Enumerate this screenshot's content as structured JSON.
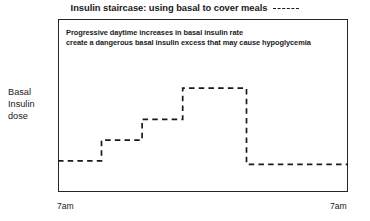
{
  "chart_data": {
    "type": "line",
    "title": "Insulin staircase: using basal to cover meals",
    "xlabel": "",
    "ylabel": "Basal Insulin dose",
    "annotation_lines": [
      "Progressive daytime increases in basal insulin rate",
      "create a dangerous basal insulin excess that may cause hypoglycemia"
    ],
    "x_tick_labels": [
      "7am",
      "7am"
    ],
    "y_tick_labels": [],
    "grid": false,
    "legend_position": "title-inline",
    "series": [
      {
        "name": "Basal insulin rate",
        "style": "dashed",
        "color": "#1a1a1a",
        "step_type": "post",
        "x": [
          0,
          15,
          15,
          29,
          29,
          43,
          43,
          65,
          65,
          100
        ],
        "y": [
          18,
          18,
          30,
          30,
          42,
          42,
          60,
          60,
          16,
          16
        ],
        "segments": [
          {
            "label": "overnight basal",
            "x_start": 0,
            "x_end": 15,
            "level": 18
          },
          {
            "label": "morning step",
            "x_start": 15,
            "x_end": 29,
            "level": 30
          },
          {
            "label": "midday step",
            "x_start": 29,
            "x_end": 43,
            "level": 42
          },
          {
            "label": "evening peak",
            "x_start": 43,
            "x_end": 65,
            "level": 60
          },
          {
            "label": "night drop",
            "x_start": 65,
            "x_end": 100,
            "level": 16
          }
        ]
      }
    ],
    "xlim": [
      0,
      100
    ],
    "ylim": [
      0,
      100
    ]
  },
  "title": {
    "text": "Insulin staircase: using basal to cover meals",
    "legend_marker": "dashed-line"
  },
  "axes": {
    "y_label_lines": [
      "Basal",
      "Insulin",
      "dose"
    ],
    "x_left_label": "7am",
    "x_right_label": "7am"
  },
  "annotation": {
    "line1": "Progressive daytime increases in basal insulin rate",
    "line2": "create a dangerous basal insulin excess that may cause hypoglycemia"
  },
  "colors": {
    "ink": "#1a1a1a",
    "frame": "#262626",
    "background": "#ffffff"
  }
}
